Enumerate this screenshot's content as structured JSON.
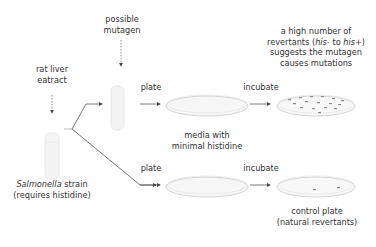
{
  "labels": {
    "possible_mutagen_1": "possible",
    "possible_mutagen_2": "mutagen",
    "rat_liver_1": "rat liver",
    "rat_liver_2": "eatract",
    "plate_top": "plate",
    "incubate_top": "incubate",
    "result_1": "a high number of",
    "result_2a": "revertants (",
    "result_2b": "his-",
    "result_2c": " to ",
    "result_2d": "his+",
    "result_2e": ")",
    "result_3": "suggests the mutagen",
    "result_4": "causes mutations",
    "media_1": "media with",
    "media_2": "minimal histidine",
    "strain_italic": "Salmonella",
    "strain_rest": " strain",
    "strain_2": "(requires histidine)",
    "plate_bottom": "plate",
    "incubate_bottom": "incubate",
    "control_1": "control plate",
    "control_2": "(natural revertants)"
  },
  "colors": {
    "line": "#555555",
    "tube": "#e6e6e6",
    "plate": "#f3f3f3",
    "colony": "#8a8a8a"
  }
}
